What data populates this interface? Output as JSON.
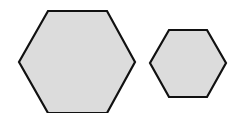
{
  "diagram": {
    "background": "#ffffff",
    "fill_color": "#dcdcdc",
    "stroke_color": "#111111",
    "shapes": [
      {
        "id": "large-hexagon",
        "type": "hexagon",
        "points": "48,11 107,11 135,62 107,113 48,113 19,62"
      },
      {
        "id": "small-hexagon",
        "type": "hexagon",
        "points": "169,30 207,30 226,63 207,97 169,97 150,63"
      }
    ]
  }
}
